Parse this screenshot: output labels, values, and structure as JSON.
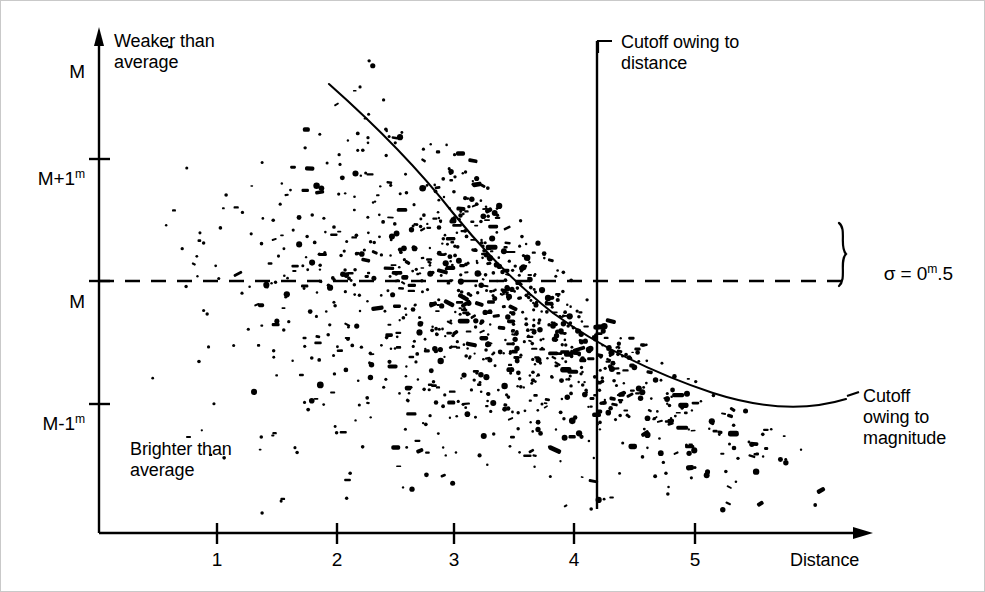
{
  "figure": {
    "background_color": "#ffffff",
    "ink_color": "#000000"
  },
  "labels": {
    "weaker_than_average": "Weaker than\naverage",
    "brighter_than_average": "Brighter than\naverage",
    "cutoff_distance": "Cutoff owing to\ndistance",
    "cutoff_magnitude": "Cutoff\nowing to\nmagnitude",
    "sigma_prefix": "σ = 0",
    "sigma_sup": "m",
    "sigma_suffix": ".5",
    "x_axis_name": "Distance"
  },
  "y_axis": {
    "ticks": [
      {
        "base": "M",
        "sup": "",
        "suffix": "",
        "value": 1.0
      },
      {
        "base": "M+1",
        "sup": "m",
        "suffix": "",
        "value": 0.5
      },
      {
        "base": "M",
        "sup": "",
        "suffix": "",
        "value": 0.0
      },
      {
        "base": "M-1",
        "sup": "m",
        "suffix": "",
        "value": -0.5
      }
    ]
  },
  "chart_data": {
    "type": "scatter",
    "title": "",
    "xlabel": "Distance",
    "ylabel": "Magnitude relative to mean M",
    "xlim": [
      0,
      6.5
    ],
    "ylim": [
      -1.6,
      1.6
    ],
    "xticks": [
      1,
      2,
      3,
      4,
      5
    ],
    "xtick_labels": [
      "1",
      "2",
      "3",
      "4",
      "5"
    ],
    "yticks": [
      1.0,
      0.5,
      0.0,
      -0.5
    ],
    "ytick_labels": [
      "M",
      "M+1m",
      "M",
      "M-1m"
    ],
    "grid": false,
    "legend": "none",
    "reference_lines": [
      {
        "name": "mean-magnitude-line",
        "orientation": "horizontal",
        "y": 0.0,
        "style": "dashed",
        "label": "M"
      },
      {
        "name": "distance-cutoff-line",
        "orientation": "vertical",
        "x": 4.2,
        "style": "solid",
        "label": "Cutoff owing to distance"
      }
    ],
    "curves": [
      {
        "name": "magnitude-cutoff-curve",
        "label": "Cutoff owing to magnitude",
        "style": "solid",
        "points": [
          [
            1.95,
            1.28
          ],
          [
            2.2,
            1.12
          ],
          [
            2.5,
            0.92
          ],
          [
            2.8,
            0.72
          ],
          [
            3.1,
            0.52
          ],
          [
            3.4,
            0.33
          ],
          [
            3.6,
            0.2
          ],
          [
            3.8,
            0.08
          ],
          [
            4.0,
            -0.02
          ],
          [
            4.3,
            -0.15
          ],
          [
            4.6,
            -0.27
          ],
          [
            5.0,
            -0.41
          ],
          [
            5.4,
            -0.53
          ],
          [
            5.8,
            -0.64
          ],
          [
            6.1,
            -0.73
          ]
        ]
      }
    ],
    "scatter": {
      "name": "galaxy-sample",
      "n_points": 1150,
      "marker": "dot",
      "marker_size_px": [
        2,
        5
      ],
      "color": "#000000",
      "sigma": 0.5,
      "sigma_units": "magnitudes",
      "x_range": [
        0.35,
        6.15
      ],
      "density_profile": "increasing with distance (volume-limited growth)",
      "truncations": [
        "upper envelope follows magnitude-cutoff curve (faint limit)",
        "right edge truncated at distance 6.15 (survey limit)"
      ]
    },
    "annotations": [
      {
        "name": "weaker-than-average",
        "text": "Weaker than average",
        "x": 0.45,
        "y": 1.45
      },
      {
        "name": "brighter-than-average",
        "text": "Brighter than average",
        "x": 0.45,
        "y": -0.95
      },
      {
        "name": "cutoff-distance",
        "text": "Cutoff owing to distance",
        "x": 4.35,
        "y": 1.5
      },
      {
        "name": "cutoff-magnitude",
        "text": "Cutoff owing to magnitude",
        "x": 6.3,
        "y": -0.6
      },
      {
        "name": "sigma-spread",
        "text": "σ = 0m.5",
        "x": 6.3,
        "y": 0.13
      }
    ]
  }
}
